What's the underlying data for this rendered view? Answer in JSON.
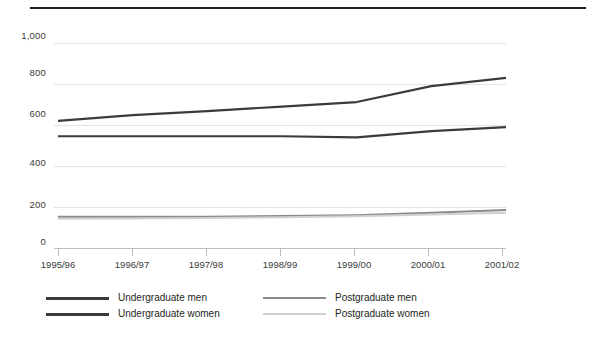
{
  "chart_data": {
    "type": "line",
    "title": "",
    "subtitle": "",
    "xlabel": "",
    "ylabel": "Thousands",
    "x": [
      "1995/96",
      "1996/97",
      "1997/98",
      "1998/99",
      "1999/00",
      "2000/01",
      "2001/02"
    ],
    "categories": [
      "1995/96",
      "1996/97",
      "1997/98",
      "1998/99",
      "1999/00",
      "2000/01",
      "2001/02"
    ],
    "ylim": [
      0,
      1000
    ],
    "yticks": [
      "0",
      "200",
      "400",
      "600",
      "800",
      "1,000"
    ],
    "ytick_values": [
      0,
      200,
      400,
      600,
      800,
      1000
    ],
    "grid": true,
    "legend_position": "bottom",
    "series": [
      {
        "name": "Undergraduate men",
        "color": "#3b3b3b",
        "width": 2.2,
        "values": [
          620,
          648,
          668,
          690,
          712,
          790,
          830
        ]
      },
      {
        "name": "Undergraduate women",
        "color": "#3b3b3b",
        "width": 2.2,
        "values": [
          545,
          545,
          545,
          545,
          540,
          570,
          590
        ]
      },
      {
        "name": "Postgraduate men",
        "color": "#8a8a8a",
        "width": 2.0,
        "values": [
          152,
          152,
          153,
          156,
          160,
          172,
          185
        ]
      },
      {
        "name": "Postgraduate women",
        "color": "#d0d0d0",
        "width": 2.0,
        "values": [
          143,
          144,
          146,
          150,
          155,
          163,
          172
        ]
      }
    ]
  },
  "axis": {
    "y_title": "Thousands",
    "y_ticks": [
      {
        "label": "1,000",
        "value": 1000
      },
      {
        "label": "800",
        "value": 800
      },
      {
        "label": "600",
        "value": 600
      },
      {
        "label": "400",
        "value": 400
      },
      {
        "label": "200",
        "value": 200
      },
      {
        "label": "0",
        "value": 0
      }
    ],
    "x_ticks": [
      {
        "label": "1995/96"
      },
      {
        "label": "1996/97"
      },
      {
        "label": "1997/98"
      },
      {
        "label": "1998/99"
      },
      {
        "label": "1999/00"
      },
      {
        "label": "2000/01"
      },
      {
        "label": "2001/02"
      }
    ]
  },
  "legend": {
    "items": [
      {
        "label": "Undergraduate men",
        "color": "#3b3b3b"
      },
      {
        "label": "Undergraduate women",
        "color": "#3b3b3b"
      },
      {
        "label": "Postgraduate men",
        "color": "#8a8a8a"
      },
      {
        "label": "Postgraduate women",
        "color": "#d0d0d0"
      }
    ]
  },
  "style": {
    "background": "#ffffff",
    "rule_color": "#231f20",
    "grid_color": "#e3e3e3",
    "axis_color": "#bcbcbc",
    "text_color": "#231f20"
  }
}
